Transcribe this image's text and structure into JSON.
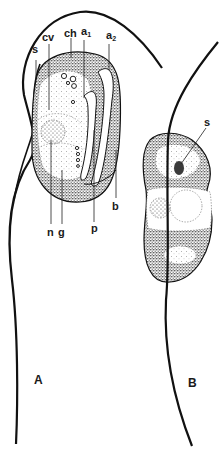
{
  "figure": {
    "panels": [
      {
        "id": "A",
        "label": "A"
      },
      {
        "id": "B",
        "label": "B"
      }
    ],
    "panel_a_labels": {
      "s": "s",
      "cv": "cv",
      "ch": "ch",
      "a1_base": "a",
      "a1_sub": "1",
      "a2_base": "a",
      "a2_sub": "2",
      "b": "b",
      "p": "p",
      "n": "n",
      "g": "g"
    },
    "panel_b_labels": {
      "s": "s"
    },
    "colors": {
      "ink": "#1a1a1a",
      "stipple_dark": "#6e6e6e",
      "stipple_light": "#c8c8c8",
      "background": "#ffffff"
    }
  }
}
